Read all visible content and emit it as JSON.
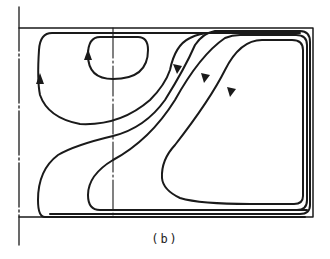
{
  "figure": {
    "caption": "(b)",
    "colors": {
      "line": "#1a1a1a",
      "background": "#ffffff"
    },
    "elements": {
      "symmetry_axis_left": "dash-dot vertical line",
      "center_line": "dash-dot vertical line",
      "frame": "rectangular boundary (top, right, bottom)",
      "small_vortex": "closed loop, counter-clockwise, arrow pointing up",
      "large_left_loop": "streamline, arrow pointing up",
      "nested_streamlines": "three S-shaped streamlines with downward arrows wrapping around right and bottom walls"
    }
  }
}
